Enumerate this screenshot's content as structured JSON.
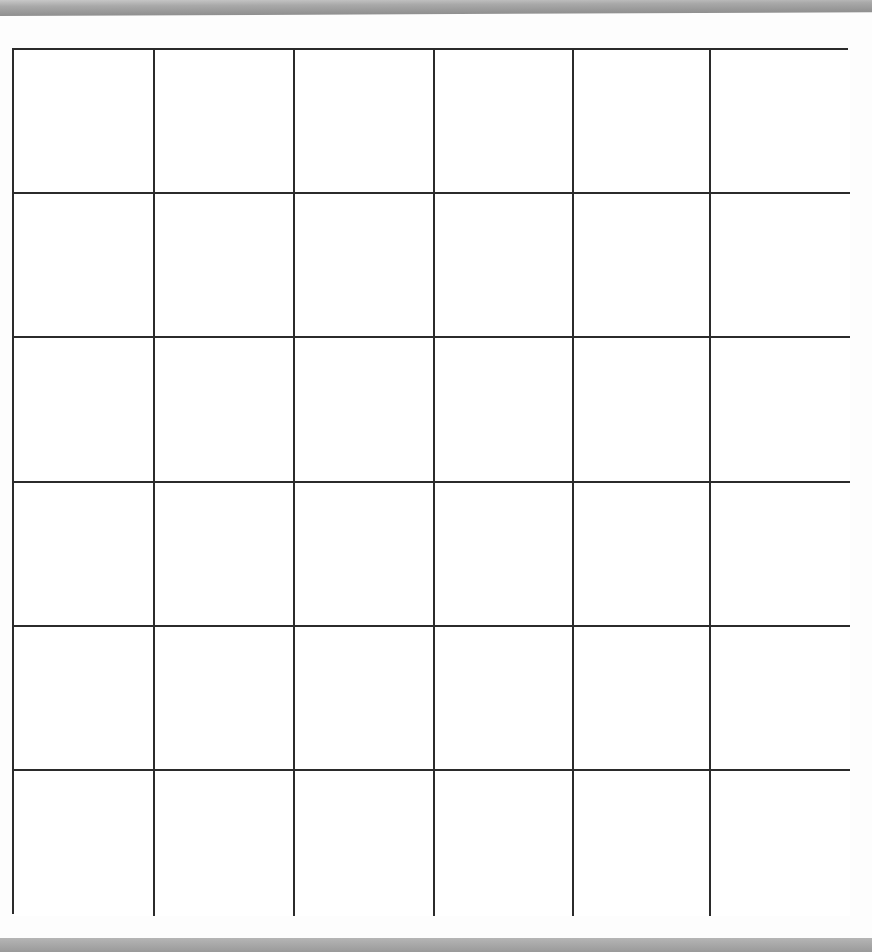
{
  "grid": {
    "rows": 6,
    "columns": 6,
    "line_color": "#2b2b2b",
    "cell_fill": "#ffffff",
    "cells_filled": []
  },
  "bands": {
    "top_color": "#a0a0a0",
    "bottom_color": "#a5a5a5"
  }
}
